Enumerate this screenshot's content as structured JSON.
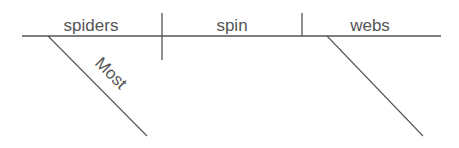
{
  "diagram": {
    "type": "sentence-diagram",
    "colors": {
      "line": "#555555",
      "text": "#555555",
      "background": "#ffffff"
    },
    "baseline": {
      "subject": "spiders",
      "verb": "spin",
      "object": "webs"
    },
    "modifiers": [
      {
        "attached_to": "spiders",
        "word": "Most"
      },
      {
        "attached_to": "webs",
        "word": ""
      }
    ]
  }
}
